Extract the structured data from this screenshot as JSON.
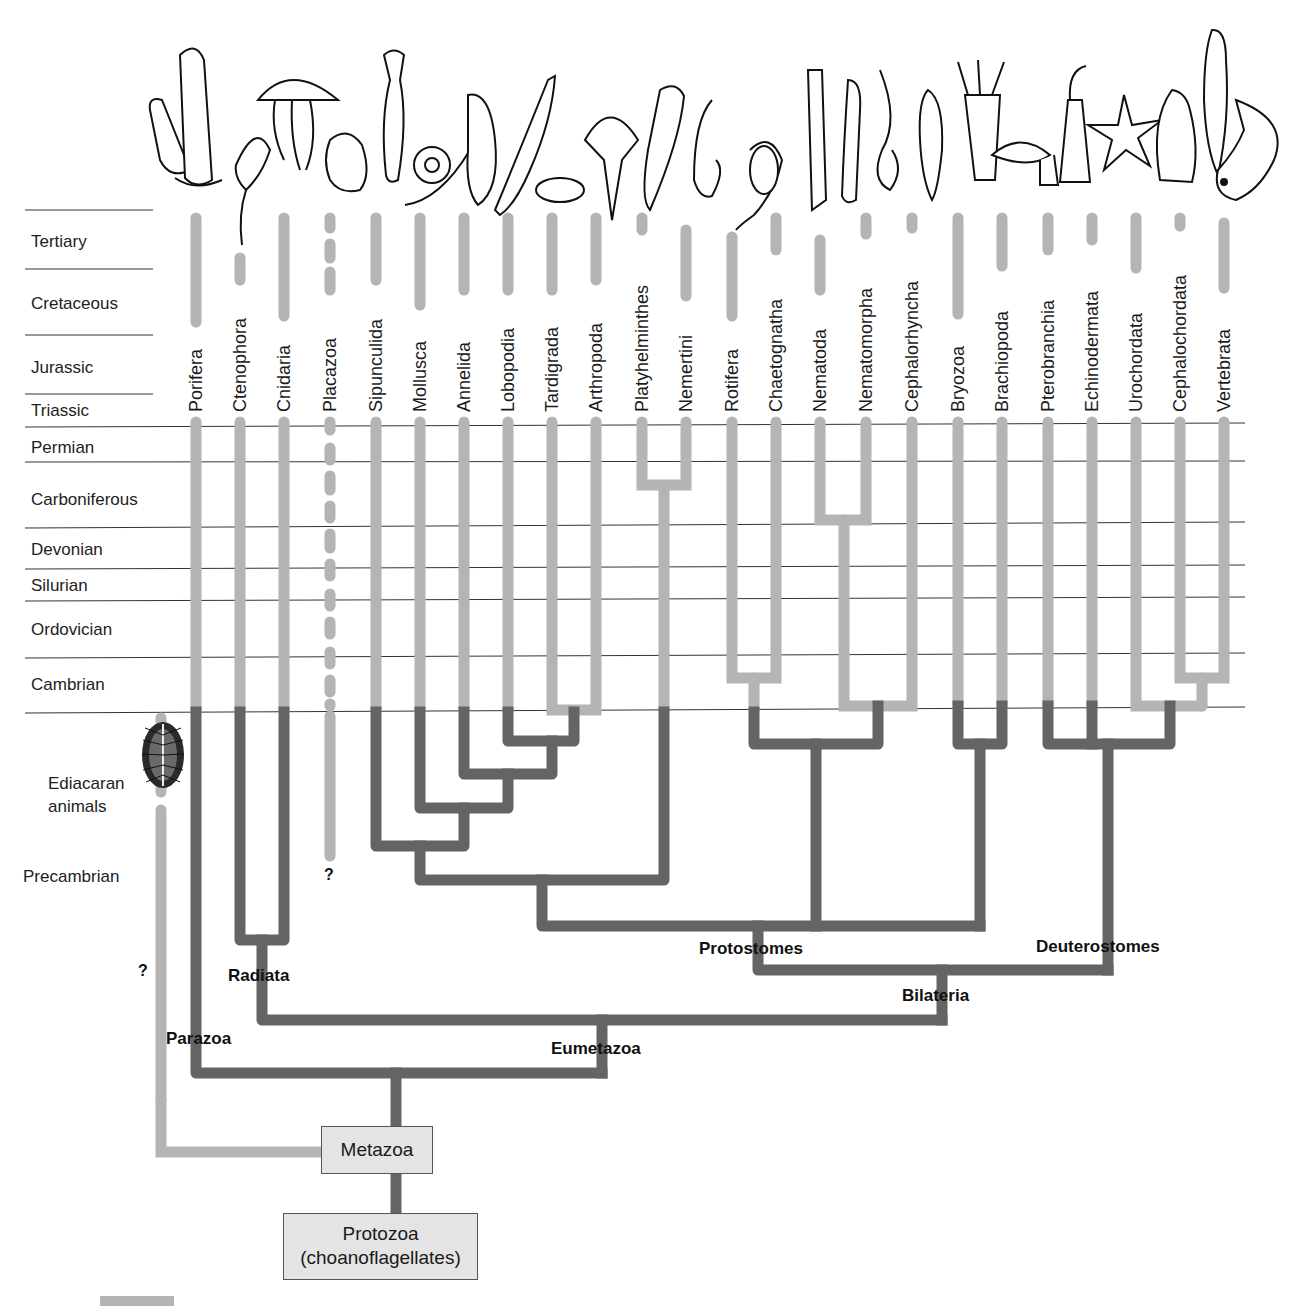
{
  "colors": {
    "fossil_record": "#b4b4b4",
    "inferred_lineage": "#646464",
    "gridline": "#333333",
    "box_fill": "#e4e4e4"
  },
  "periods": [
    {
      "label": "Tertiary",
      "y": 242
    },
    {
      "label": "Cretaceous",
      "y": 304
    },
    {
      "label": "Jurassic",
      "y": 368
    },
    {
      "label": "Triassic",
      "y": 411
    },
    {
      "label": "Permian",
      "y": 448
    },
    {
      "label": "Carboniferous",
      "y": 500
    },
    {
      "label": "Devonian",
      "y": 550
    },
    {
      "label": "Silurian",
      "y": 586
    },
    {
      "label": "Ordovician",
      "y": 630
    },
    {
      "label": "Cambrian",
      "y": 685
    }
  ],
  "precambrian": {
    "ediacaran_line1": "Ediacaran",
    "ediacaran_line2": "animals",
    "precambrian_label": "Precambrian"
  },
  "taxa": [
    {
      "label": "Porifera",
      "x": 196
    },
    {
      "label": "Ctenophora",
      "x": 240
    },
    {
      "label": "Cnidaria",
      "x": 284
    },
    {
      "label": "Placazoa",
      "x": 330
    },
    {
      "label": "Sipunculida",
      "x": 376
    },
    {
      "label": "Mollusca",
      "x": 420
    },
    {
      "label": "Annelida",
      "x": 464
    },
    {
      "label": "Lobopodia",
      "x": 508
    },
    {
      "label": "Tardigrada",
      "x": 552
    },
    {
      "label": "Arthropoda",
      "x": 596
    },
    {
      "label": "Platyhelminthes",
      "x": 642
    },
    {
      "label": "Nemertini",
      "x": 686
    },
    {
      "label": "Rotifera",
      "x": 732
    },
    {
      "label": "Chaetognatha",
      "x": 776
    },
    {
      "label": "Nematoda",
      "x": 820
    },
    {
      "label": "Nematomorpha",
      "x": 866
    },
    {
      "label": "Cephalorhyncha",
      "x": 912
    },
    {
      "label": "Bryozoa",
      "x": 958
    },
    {
      "label": "Brachiopoda",
      "x": 1002
    },
    {
      "label": "Pterobranchia",
      "x": 1048
    },
    {
      "label": "Echinodermata",
      "x": 1092
    },
    {
      "label": "Urochordata",
      "x": 1136
    },
    {
      "label": "Cephalochordata",
      "x": 1180
    },
    {
      "label": "Vertebrata",
      "x": 1224
    }
  ],
  "clades": {
    "parazoa": "Parazoa",
    "radiata": "Radiata",
    "eumetazoa": "Eumetazoa",
    "bilateria": "Bilateria",
    "protostomes": "Protostomes",
    "deuterostomes": "Deuterostomes"
  },
  "question_marks": {
    "placazoa": "?",
    "ediacaran": "?"
  },
  "root_boxes": {
    "metazoa": "Metazoa",
    "protozoa_line1": "Protozoa",
    "protozoa_line2": "(choanoflagellates)"
  }
}
